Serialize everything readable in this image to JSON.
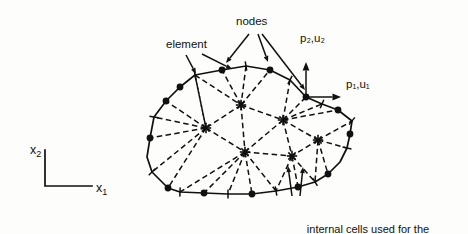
{
  "figure": {
    "type": "boundary-element-mesh-diagram",
    "background_color": "#fdfdfb",
    "ink_color": "#111111",
    "width": 468,
    "height": 234
  },
  "labels": {
    "element": "element",
    "nodes": "nodes",
    "traction_vertical": "p",
    "traction_vertical_sub": "2",
    "traction_vertical_second": "u",
    "traction_vertical_second_sub": "2",
    "traction_vertical_full": "p₂,u₂",
    "traction_horizontal_full": "p₁,u₁",
    "caption_line1": "internal cells used for the",
    "caption_line2": "integration of body force terms"
  },
  "axes": {
    "vertical_label": "x",
    "vertical_sub": "2",
    "horizontal_label": "x",
    "horizontal_sub": "1",
    "origin_x": 45,
    "origin_y": 186,
    "vertical_top_y": 150,
    "horizontal_right_x": 92
  },
  "vectors": [
    {
      "name": "p2-u2",
      "label_p": "p",
      "label_p_sub": "2",
      "label_u": "u",
      "label_u_sub": "2",
      "direction": "up",
      "origin": [
        306,
        97
      ],
      "tip": [
        306,
        62
      ]
    },
    {
      "name": "p1-u1",
      "label_p": "p",
      "label_p_sub": "1",
      "label_u": "u",
      "label_u_sub": "1",
      "direction": "right",
      "origin": [
        306,
        97
      ],
      "tip": [
        341,
        97
      ]
    }
  ],
  "geometry": {
    "boundary_vertices": [
      [
        195,
        75
      ],
      [
        222,
        70
      ],
      [
        246,
        66
      ],
      [
        270,
        70
      ],
      [
        290,
        80
      ],
      [
        306,
        97
      ],
      [
        322,
        104
      ],
      [
        338,
        110
      ],
      [
        352,
        121
      ],
      [
        350,
        134
      ],
      [
        347,
        148
      ],
      [
        340,
        162
      ],
      [
        328,
        174
      ],
      [
        315,
        182
      ],
      [
        298,
        187
      ],
      [
        276,
        191
      ],
      [
        252,
        194
      ],
      [
        228,
        194
      ],
      [
        204,
        193
      ],
      [
        180,
        192
      ],
      [
        168,
        188
      ],
      [
        152,
        172
      ],
      [
        147,
        157
      ],
      [
        150,
        138
      ],
      [
        154,
        117
      ],
      [
        166,
        101
      ],
      [
        180,
        87
      ]
    ],
    "boundary_nodes": [
      [
        222,
        70
      ],
      [
        270,
        70
      ],
      [
        306,
        97
      ],
      [
        338,
        110
      ],
      [
        350,
        134
      ],
      [
        328,
        174
      ],
      [
        298,
        187
      ],
      [
        252,
        194
      ],
      [
        204,
        193
      ],
      [
        168,
        188
      ],
      [
        150,
        138
      ],
      [
        166,
        101
      ],
      [
        180,
        87
      ]
    ],
    "boundary_ticks": [
      [
        246,
        66
      ],
      [
        290,
        80
      ],
      [
        322,
        104
      ],
      [
        352,
        121
      ],
      [
        347,
        148
      ],
      [
        315,
        182
      ],
      [
        276,
        191
      ],
      [
        228,
        194
      ],
      [
        180,
        192
      ],
      [
        152,
        172
      ],
      [
        154,
        117
      ],
      [
        195,
        75
      ]
    ],
    "interior_stars": [
      [
        241,
        105
      ],
      [
        206,
        128
      ],
      [
        283,
        120
      ],
      [
        245,
        152
      ],
      [
        318,
        140
      ],
      [
        292,
        156
      ]
    ],
    "cell_edges": [
      [
        [
          195,
          75
        ],
        [
          241,
          105
        ]
      ],
      [
        [
          195,
          75
        ],
        [
          206,
          128
        ]
      ],
      [
        [
          246,
          66
        ],
        [
          241,
          105
        ]
      ],
      [
        [
          290,
          80
        ],
        [
          283,
          120
        ]
      ],
      [
        [
          241,
          105
        ],
        [
          283,
          120
        ]
      ],
      [
        [
          241,
          105
        ],
        [
          206,
          128
        ]
      ],
      [
        [
          241,
          105
        ],
        [
          245,
          152
        ]
      ],
      [
        [
          206,
          128
        ],
        [
          245,
          152
        ]
      ],
      [
        [
          206,
          128
        ],
        [
          150,
          138
        ]
      ],
      [
        [
          206,
          128
        ],
        [
          154,
          117
        ]
      ],
      [
        [
          206,
          128
        ],
        [
          152,
          172
        ]
      ],
      [
        [
          283,
          120
        ],
        [
          245,
          152
        ]
      ],
      [
        [
          283,
          120
        ],
        [
          318,
          140
        ]
      ],
      [
        [
          283,
          120
        ],
        [
          322,
          104
        ]
      ],
      [
        [
          283,
          120
        ],
        [
          292,
          156
        ]
      ],
      [
        [
          245,
          152
        ],
        [
          292,
          156
        ]
      ],
      [
        [
          245,
          152
        ],
        [
          228,
          194
        ]
      ],
      [
        [
          245,
          152
        ],
        [
          180,
          192
        ]
      ],
      [
        [
          245,
          152
        ],
        [
          276,
          191
        ]
      ],
      [
        [
          318,
          140
        ],
        [
          292,
          156
        ]
      ],
      [
        [
          318,
          140
        ],
        [
          352,
          121
        ]
      ],
      [
        [
          318,
          140
        ],
        [
          347,
          148
        ]
      ],
      [
        [
          318,
          140
        ],
        [
          315,
          182
        ]
      ],
      [
        [
          292,
          156
        ],
        [
          315,
          182
        ]
      ],
      [
        [
          292,
          156
        ],
        [
          276,
          191
        ]
      ],
      [
        [
          206,
          128
        ],
        [
          195,
          75
        ]
      ],
      [
        [
          241,
          105
        ],
        [
          222,
          70
        ]
      ],
      [
        [
          283,
          120
        ],
        [
          306,
          97
        ]
      ],
      [
        [
          245,
          152
        ],
        [
          252,
          194
        ]
      ],
      [
        [
          318,
          140
        ],
        [
          328,
          174
        ]
      ],
      [
        [
          292,
          156
        ],
        [
          298,
          187
        ]
      ],
      [
        [
          206,
          128
        ],
        [
          168,
          188
        ]
      ],
      [
        [
          241,
          105
        ],
        [
          270,
          70
        ]
      ],
      [
        [
          283,
          120
        ],
        [
          338,
          110
        ]
      ],
      [
        [
          245,
          152
        ],
        [
          204,
          193
        ]
      ],
      [
        [
          206,
          128
        ],
        [
          166,
          101
        ]
      ]
    ]
  },
  "leaders": {
    "element": [
      {
        "from": [
          202,
          54
        ],
        "to": [
          232,
          69
        ]
      },
      {
        "from": [
          186,
          55
        ],
        "to": [
          196,
          74
        ]
      }
    ],
    "nodes": [
      {
        "from": [
          249,
          34
        ],
        "to": [
          226,
          63
        ]
      },
      {
        "from": [
          258,
          34
        ],
        "to": [
          268,
          62
        ]
      },
      {
        "from": [
          262,
          34
        ],
        "to": [
          305,
          90
        ]
      }
    ],
    "caption": [
      {
        "from": [
          292,
          196
        ],
        "to": [
          288,
          166
        ]
      },
      {
        "from": [
          300,
          196
        ],
        "to": [
          303,
          167
        ]
      }
    ]
  }
}
